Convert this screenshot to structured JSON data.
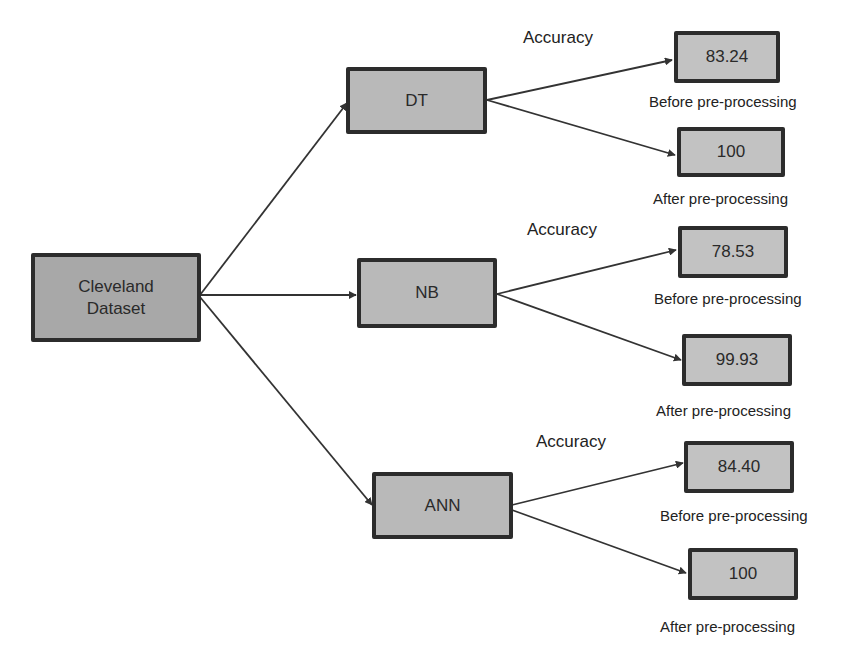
{
  "diagram": {
    "root": {
      "label": "Cleveland Dataset",
      "line1": "Cleveland",
      "line2": "Dataset"
    },
    "models": [
      {
        "name": "DT",
        "accuracy_label": "Accuracy",
        "before": {
          "value": "83.24",
          "caption": "Before pre-processing"
        },
        "after": {
          "value": "100",
          "caption": "After pre-processing"
        }
      },
      {
        "name": "NB",
        "accuracy_label": "Accuracy",
        "before": {
          "value": "78.53",
          "caption": "Before pre-processing"
        },
        "after": {
          "value": "99.93",
          "caption": "After pre-processing"
        }
      },
      {
        "name": "ANN",
        "accuracy_label": "Accuracy",
        "before": {
          "value": "84.40",
          "caption": "Before pre-processing"
        },
        "after": {
          "value": "100",
          "caption": "After pre-processing"
        }
      }
    ],
    "colors": {
      "node_fill": "#b9b9b9",
      "node_border": "#2c2c2c",
      "edge": "#333333",
      "background": "#ffffff"
    }
  }
}
